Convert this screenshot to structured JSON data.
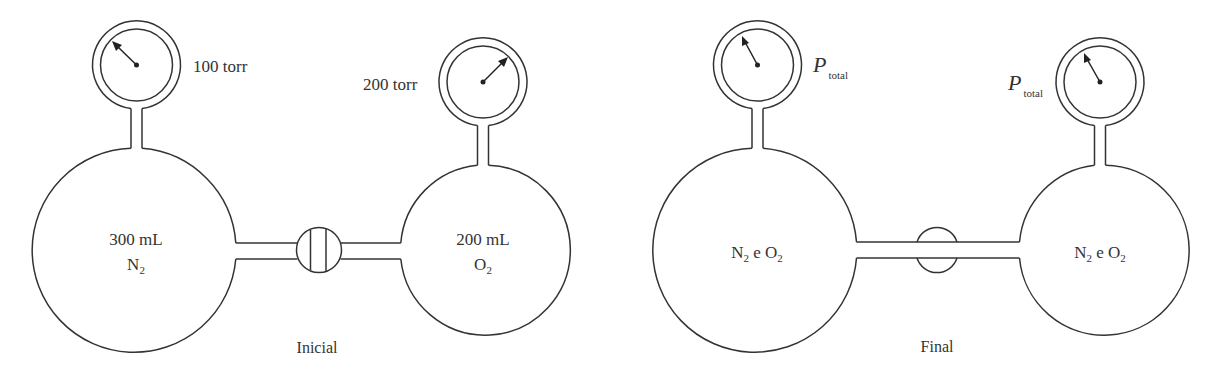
{
  "panels": [
    {
      "id": "initial",
      "caption": "Inicial",
      "valve_state": "closed",
      "left_flask": {
        "volume": "300 mL",
        "gas": "N",
        "gas_sub": "2",
        "gauge": {
          "reading": "100 torr",
          "needle_direction": "up-left"
        }
      },
      "right_flask": {
        "volume": "200 mL",
        "gas": "O",
        "gas_sub": "2",
        "gauge": {
          "reading": "200 torr",
          "needle_direction": "up-right"
        }
      }
    },
    {
      "id": "final",
      "caption": "Final",
      "valve_state": "open",
      "left_flask": {
        "contents": {
          "gas1": "N",
          "gas1_sub": "2",
          "conj": "e",
          "gas2": "O",
          "gas2_sub": "2"
        },
        "gauge": {
          "reading_symbol": "P",
          "reading_sub": "total",
          "needle_direction": "up-left"
        }
      },
      "right_flask": {
        "contents": {
          "gas1": "N",
          "gas1_sub": "2",
          "conj": "e",
          "gas2": "O",
          "gas2_sub": "2"
        },
        "gauge": {
          "reading_symbol": "P",
          "reading_sub": "total",
          "needle_direction": "up-left"
        }
      }
    }
  ],
  "colors": {
    "stroke": "#333333",
    "background": "#ffffff",
    "text": "#333333"
  }
}
